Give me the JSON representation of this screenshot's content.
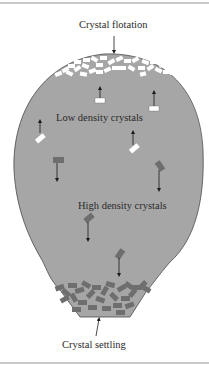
{
  "figure": {
    "labels": {
      "top": "Crystal flotation",
      "low_density": "Low density crystals",
      "high_density": "High density crystals",
      "bottom": "Crystal settling"
    },
    "colors": {
      "chamber_fill": "#a6a6a6",
      "outline": "#4a4a4a",
      "low_density_crystal": "#ffffff",
      "high_density_crystal": "#6e6e6e",
      "arrow": "#1a1a1a",
      "frame_rule": "#c9c9c9"
    },
    "icons": {
      "flotation_arrow": "arrow-down-icon",
      "settling_arrow": "arrow-up-icon",
      "rising_arrow": "arrow-up-icon",
      "sinking_arrow": "arrow-down-icon"
    }
  }
}
